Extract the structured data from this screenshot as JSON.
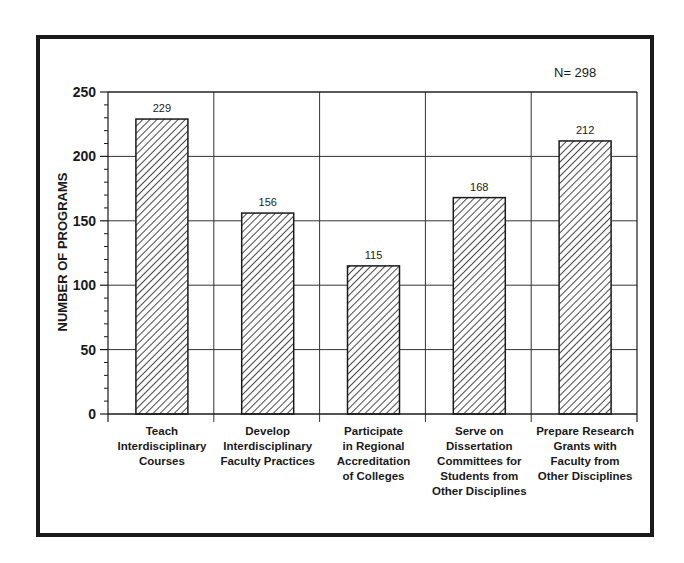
{
  "chart_data": {
    "type": "bar",
    "title": "",
    "annotation": "N= 298",
    "xlabel": "",
    "ylabel": "NUMBER OF PROGRAMS",
    "ylim": [
      0,
      250
    ],
    "yticks": [
      0,
      50,
      100,
      150,
      200,
      250
    ],
    "ytick_labels": [
      "0",
      "50",
      "100",
      "150",
      "200",
      "250"
    ],
    "minor_tick_step": 10,
    "grid": true,
    "legend": null,
    "bar_pattern": "diagonal-hatch",
    "categories": [
      "Teach Interdisciplinary Courses",
      "Develop Interdisciplinary Faculty Practices",
      "Participate in Regional Accreditation of Colleges",
      "Serve on Dissertation Committees for Students from Other Disciplines",
      "Prepare Research Grants with Faculty from Other Disciplines"
    ],
    "category_lines": [
      [
        "Teach",
        "Interdisciplinary",
        "Courses"
      ],
      [
        "Develop",
        "Interdisciplinary",
        "Faculty Practices"
      ],
      [
        "Participate",
        "in Regional",
        "Accreditation",
        "of Colleges"
      ],
      [
        "Serve on",
        "Dissertation",
        "Committees for",
        "Students from",
        "Other Disciplines"
      ],
      [
        "Prepare Research",
        "Grants with",
        "Faculty from",
        "Other Disciplines"
      ]
    ],
    "values": [
      229,
      156,
      115,
      168,
      212
    ],
    "value_labels": [
      "229",
      "156",
      "115",
      "168",
      "212"
    ]
  },
  "colors": {
    "ink": "#1a1a1a",
    "grid": "#333333",
    "background": "#ffffff"
  }
}
